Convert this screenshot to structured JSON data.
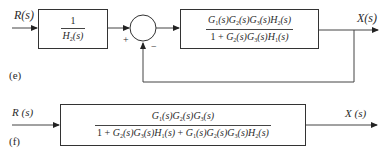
{
  "diagram_e": {
    "tag": "(e)",
    "input_label": "R(s)",
    "output_label": "X(s)",
    "block1": {
      "numerator": "1",
      "denominator": "H2(s)"
    },
    "summing_junction": {
      "plus_sign": "+",
      "minus_sign": "−"
    },
    "block2": {
      "numerator": "G1(s)G2(s)G3(s)H2(s)",
      "denominator": "1 + G2(s)G3(s)H1(s)"
    },
    "feedback": "unity negative feedback from X(s) to summing junction"
  },
  "diagram_f": {
    "tag": "(f)",
    "input_label": "R (s)",
    "output_label": "X (s)",
    "block": {
      "numerator": "G1(s)G2(s)G3(s)",
      "denominator": "1 + G2(s)G3(s)H1(s) + G1(s)G2(s)G3(s)H2(s)"
    }
  },
  "colors": {
    "line": "#333333",
    "text": "#2a2a2a",
    "background": "#ffffff"
  }
}
